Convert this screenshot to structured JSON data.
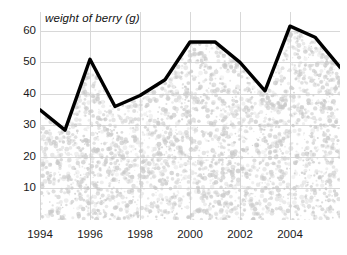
{
  "chart_data": {
    "type": "line",
    "title": "weight of berry (g)",
    "xlabel": "",
    "ylabel": "weight of berry (g)",
    "x": [
      1994,
      1995,
      1996,
      1997,
      1998,
      1999,
      2000,
      2001,
      2002,
      2003,
      2004,
      2005,
      2006
    ],
    "values": [
      35,
      28.5,
      51,
      36,
      39.5,
      44.5,
      56.5,
      56.5,
      50,
      41,
      61.5,
      58,
      48.5
    ],
    "series": [
      {
        "name": "weight of berry (g)",
        "values": [
          35,
          28.5,
          51,
          36,
          39.5,
          44.5,
          56.5,
          56.5,
          50,
          41,
          61.5,
          58,
          48.5
        ]
      }
    ],
    "xlim": [
      1994,
      2006
    ],
    "ylim": [
      0,
      66
    ],
    "xticks": [
      1994,
      1996,
      1998,
      2000,
      2002,
      2004
    ],
    "xtick_labels": [
      "1994",
      "1996",
      "1998",
      "2000",
      "2002",
      "2004"
    ],
    "yticks": [
      10,
      20,
      30,
      40,
      50,
      60
    ],
    "ytick_labels": [
      "10",
      "20",
      "30",
      "40",
      "50",
      "60"
    ],
    "grid": true,
    "legend": false,
    "legend_position": "none",
    "line_color": "#000000",
    "grid_color": "#d8d8d8",
    "fill_texture_color": "#c9c9c9",
    "background_color": "#ffffff",
    "text_color": "#1a1a1a"
  }
}
